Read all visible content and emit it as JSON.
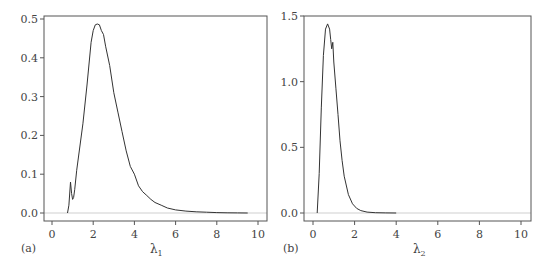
{
  "chart_data": [
    {
      "type": "line",
      "panel_label": "(a)",
      "title": "",
      "xlabel": "λ",
      "xlabel_subscript": "1",
      "ylabel": "",
      "xlim": [
        0,
        10
      ],
      "ylim": [
        0,
        0.5
      ],
      "x_ticks": [
        0,
        2,
        4,
        6,
        8,
        10
      ],
      "x_tick_labels": [
        "0",
        "2",
        "4",
        "6",
        "8",
        "10"
      ],
      "y_ticks": [
        0.0,
        0.1,
        0.2,
        0.3,
        0.4,
        0.5
      ],
      "y_tick_labels": [
        "0.0",
        "0.1",
        "0.2",
        "0.3",
        "0.4",
        "0.5"
      ],
      "grid": false,
      "baseline": 0.0,
      "series": [
        {
          "name": "density λ1",
          "x": [
            0.75,
            0.82,
            0.9,
            0.95,
            1.0,
            1.05,
            1.1,
            1.2,
            1.35,
            1.5,
            1.7,
            1.9,
            2.0,
            2.1,
            2.2,
            2.3,
            2.4,
            2.5,
            2.6,
            2.8,
            3.0,
            3.2,
            3.4,
            3.6,
            3.8,
            4.0,
            4.2,
            4.4,
            4.6,
            4.8,
            5.0,
            5.3,
            5.6,
            6.0,
            6.5,
            7.0,
            7.5,
            8.0,
            8.5,
            9.0,
            9.5
          ],
          "values": [
            0.0,
            0.02,
            0.08,
            0.05,
            0.035,
            0.04,
            0.06,
            0.11,
            0.17,
            0.23,
            0.33,
            0.44,
            0.47,
            0.485,
            0.487,
            0.485,
            0.47,
            0.46,
            0.43,
            0.38,
            0.31,
            0.26,
            0.21,
            0.16,
            0.12,
            0.1,
            0.07,
            0.055,
            0.045,
            0.035,
            0.027,
            0.02,
            0.013,
            0.008,
            0.005,
            0.003,
            0.002,
            0.001,
            0.0005,
            0.0002,
            0.0
          ]
        }
      ]
    },
    {
      "type": "line",
      "panel_label": "(b)",
      "title": "",
      "xlabel": "λ",
      "xlabel_subscript": "2",
      "ylabel": "",
      "xlim": [
        0,
        10
      ],
      "ylim": [
        0,
        1.5
      ],
      "x_ticks": [
        0,
        2,
        4,
        6,
        8,
        10
      ],
      "x_tick_labels": [
        "0",
        "2",
        "4",
        "6",
        "8",
        "10"
      ],
      "y_ticks": [
        0.0,
        0.5,
        1.0,
        1.5
      ],
      "y_tick_labels": [
        "0.0",
        "0.5",
        "1.0",
        "1.5"
      ],
      "grid": false,
      "baseline": 0.0,
      "series": [
        {
          "name": "density λ2",
          "x": [
            0.2,
            0.3,
            0.4,
            0.5,
            0.6,
            0.7,
            0.8,
            0.85,
            0.9,
            0.95,
            1.0,
            1.1,
            1.2,
            1.3,
            1.4,
            1.5,
            1.7,
            1.9,
            2.1,
            2.3,
            2.6,
            3.0,
            3.5,
            4.0
          ],
          "values": [
            0.0,
            0.3,
            0.8,
            1.2,
            1.4,
            1.44,
            1.4,
            1.32,
            1.25,
            1.3,
            1.15,
            0.95,
            0.75,
            0.55,
            0.4,
            0.28,
            0.14,
            0.07,
            0.035,
            0.018,
            0.007,
            0.002,
            0.0005,
            0.0
          ]
        }
      ]
    }
  ]
}
